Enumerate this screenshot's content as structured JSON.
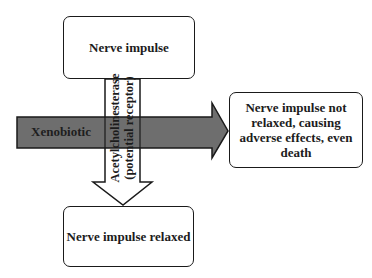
{
  "diagram": {
    "nodes": {
      "top": {
        "label": "Nerve impulse"
      },
      "bottom": {
        "label": "Nerve impulse relaxed"
      },
      "right": {
        "label": "Nerve impulse not relaxed, causing adverse effects, even death"
      }
    },
    "arrows": {
      "vertical": {
        "from": "top",
        "to": "bottom",
        "line1": "Acetylcholinesterase",
        "line2": "(potential receptor)",
        "fill": "#ffffff"
      },
      "horizontal": {
        "to": "right",
        "label": "Xenobiotic",
        "fill": "#6e6e6e"
      }
    }
  }
}
